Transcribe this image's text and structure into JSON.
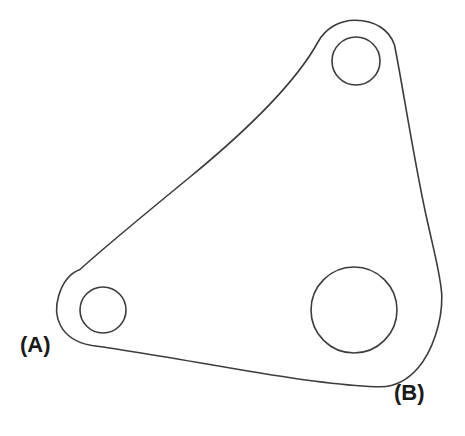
{
  "figure": {
    "kind": "engineering-line-drawing",
    "background_color": "#ffffff",
    "line_color": "#3c3c3c",
    "label_color": "#1a1a1a",
    "stroke_width": 1.6,
    "canvas": {
      "width": 465,
      "height": 436
    }
  },
  "labels": [
    {
      "id": "label-a",
      "text": "(A)",
      "x": 20,
      "y": 334,
      "points_to": "left-lobe-small-hole"
    },
    {
      "id": "label-b",
      "text": "(B)",
      "x": 394,
      "y": 382,
      "points_to": "bottom-right-corner"
    }
  ],
  "holes": [
    {
      "id": "top-hole",
      "name": "top-small-hole",
      "cx": 356,
      "cy": 61,
      "r": 24
    },
    {
      "id": "left-hole",
      "name": "left-small-hole",
      "cx": 103,
      "cy": 310,
      "r": 23
    },
    {
      "id": "large-hole",
      "name": "bottom-right-large-hole",
      "cx": 354,
      "cy": 310,
      "r": 43
    }
  ],
  "outline": {
    "id": "plate-outline",
    "description": "Closed outline of the bracket: rounded top lobe, long concave upper-left edge, rounded left lobe, gently curved bottom edge, bulged right edge.",
    "path": "M 355.5 20.2 C 375.0 20.2 389.5 30.0 394.5 45.0 C 402.0 82.0 414.0 160.0 426.0 215.0 C 434.0 252.0 441.5 278.0 441.8 296.5 C 442.2 322.0 432.0 352.0 418.0 368.0 C 408.0 379.5 395.0 386.5 381.0 386.8 C 352.0 386.5 300.0 380.0 236.0 369.0 C 175.0 358.5 124.0 350.0 92.0 345.5 C 77.0 343.0 66.0 336.0 60.5 325.5 C 56.0 317.0 55.8 305.5 58.6 296.0 C 62.5 282.8 70.5 273.0 80.0 269.5 C 99.0 252.0 140.0 218.0 190.0 177.0 C 246.0 131.0 296.0 82.0 318.0 42.0 C 325.5 28.5 339.0 20.2 355.5 20.2 Z"
  }
}
